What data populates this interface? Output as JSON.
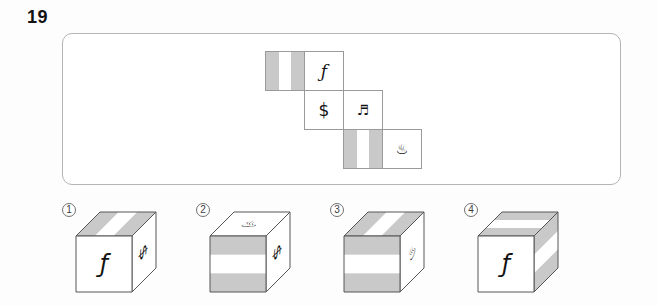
{
  "question": {
    "number": "19"
  },
  "colors": {
    "stripe_gray": "#c9c9c9",
    "cube_edge": "#565656",
    "net_edge": "#9a9a9a",
    "box_border": "#b4b4b4",
    "symbol": "#141414"
  },
  "net": {
    "rows": 3,
    "cols": 4,
    "faces": [
      {
        "row": 0,
        "col": 0,
        "type": "stripes",
        "name": "stripes-vertical"
      },
      {
        "row": 0,
        "col": 1,
        "type": "symbol",
        "symbol": "ƒ",
        "name": "florin",
        "size": 17,
        "italic": true
      },
      {
        "row": 1,
        "col": 1,
        "type": "symbol",
        "symbol": "$",
        "name": "dollar",
        "size": 17,
        "italic": false
      },
      {
        "row": 1,
        "col": 2,
        "type": "symbol",
        "symbol": "♬",
        "name": "beamed-notes",
        "size": 14,
        "italic": false
      },
      {
        "row": 2,
        "col": 2,
        "type": "stripes",
        "name": "stripes-vertical"
      },
      {
        "row": 2,
        "col": 3,
        "type": "symbol",
        "symbol": "♨",
        "name": "hot-springs",
        "size": 14,
        "italic": false
      }
    ]
  },
  "options": [
    {
      "label": "1",
      "top": {
        "type": "stripes",
        "dir": "depth"
      },
      "front": {
        "type": "symbol",
        "symbol": "ƒ",
        "name": "florin",
        "size": 24,
        "italic": true,
        "rotate": 0
      },
      "right": {
        "type": "symbol",
        "symbol": "$",
        "name": "dollar",
        "size": 23,
        "italic": false,
        "rotate": 90
      }
    },
    {
      "label": "2",
      "top": {
        "type": "symbol",
        "symbol": "♨",
        "name": "hot-springs",
        "size": 20,
        "italic": false,
        "rotate": 0
      },
      "front": {
        "type": "stripes",
        "dir": "horizontal"
      },
      "right": {
        "type": "symbol",
        "symbol": "$",
        "name": "dollar",
        "size": 23,
        "italic": false,
        "rotate": 90
      }
    },
    {
      "label": "3",
      "top": {
        "type": "stripes",
        "dir": "depth"
      },
      "front": {
        "type": "stripes",
        "dir": "horizontal"
      },
      "right": {
        "type": "symbol",
        "symbol": "♨",
        "name": "hot-springs",
        "size": 19,
        "italic": false,
        "rotate": -30
      }
    },
    {
      "label": "4",
      "top": {
        "type": "stripes",
        "dir": "across"
      },
      "front": {
        "type": "symbol",
        "symbol": "ƒ",
        "name": "florin",
        "size": 24,
        "italic": true,
        "rotate": 0
      },
      "right": {
        "type": "stripes",
        "dir": "horizontal"
      }
    }
  ]
}
